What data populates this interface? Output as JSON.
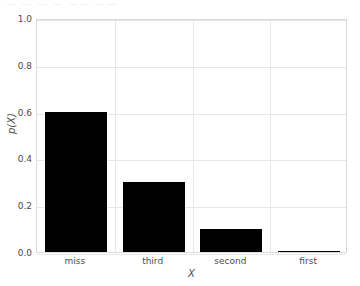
{
  "top_crop_text": "—  —  —   —  ——  ——",
  "chart_data": {
    "type": "bar",
    "title": "",
    "subtitle": "",
    "xlabel": "X",
    "ylabel": "p(X)",
    "categories": [
      "miss",
      "third",
      "second",
      "first"
    ],
    "values": [
      0.6,
      0.3,
      0.1,
      0.005
    ],
    "ylim": [
      0.0,
      1.0
    ],
    "ytick_labels": [
      "0.0",
      "0.2",
      "0.4",
      "0.6",
      "0.8",
      "1.0"
    ],
    "ytick_values": [
      0.0,
      0.2,
      0.4,
      0.6,
      0.8,
      1.0
    ],
    "xtick_labels": [
      "miss",
      "third",
      "second",
      "first"
    ],
    "grid": true,
    "grid_color": "#e6e6ea",
    "bar_color": "#000000",
    "plot_background": "#ffffff",
    "figure_background": "#ffffff",
    "axis_border_color": "#d9d9de",
    "text_color": "#4d4d4d",
    "legend": null,
    "legend_position": "none",
    "annotations": []
  }
}
